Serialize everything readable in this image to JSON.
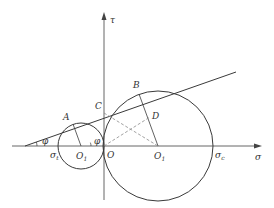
{
  "diagram": {
    "type": "mohr-circle",
    "colors": {
      "line": "#3a3a3a",
      "axis": "#555555",
      "dashed": "#8a8a8a",
      "text": "#333333"
    },
    "axes": {
      "x_label": "σ",
      "y_label": "τ"
    },
    "points": {
      "A": "A",
      "B": "B",
      "C": "C",
      "D": "D",
      "O": "O",
      "O1_small": "O",
      "O1_small_sub": "1",
      "O1_large": "O",
      "O1_large_sub": "1"
    },
    "labels": {
      "sigma_t": "σ",
      "sigma_t_sub": "t",
      "sigma_c": "σ",
      "sigma_c_sub": "c",
      "phi_left": "φ",
      "phi_center": "φ"
    }
  }
}
